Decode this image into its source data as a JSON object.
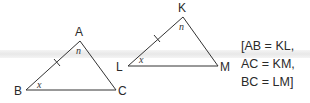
{
  "triangle_1": {
    "vertices": {
      "A": "A",
      "B": "B",
      "C": "C"
    },
    "angles": {
      "at_A": "n",
      "at_B": "x"
    },
    "tick_side": "AB"
  },
  "triangle_2": {
    "vertices": {
      "K": "K",
      "L": "L",
      "M": "M"
    },
    "angles": {
      "at_K": "n",
      "at_L": "x"
    },
    "tick_side": "KL"
  },
  "equalities": {
    "line1": "[AB = KL,",
    "line2": "AC = KM,",
    "line3": "BC = LM]"
  },
  "colors": {
    "stroke": "#333333",
    "band": "#ebebeb",
    "background": "#ffffff"
  }
}
